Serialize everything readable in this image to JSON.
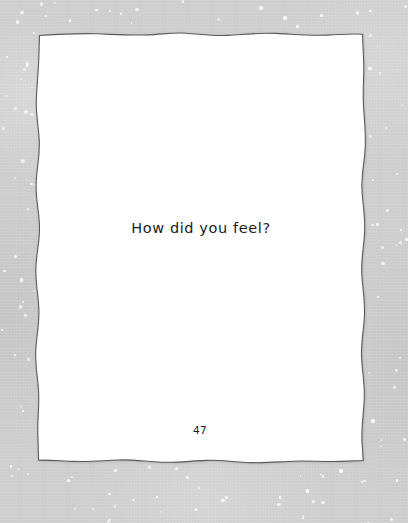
{
  "page": {
    "kind": "journal-page",
    "background_color": "#cfcfcf",
    "paper_color": "#ffffff",
    "paper_edge_color": "#5a5a5a",
    "text_color": "#1b1b1b",
    "question": "How did you feel?",
    "page_number": "47"
  },
  "speckles": {
    "color": "#ffffff",
    "count": 118
  }
}
